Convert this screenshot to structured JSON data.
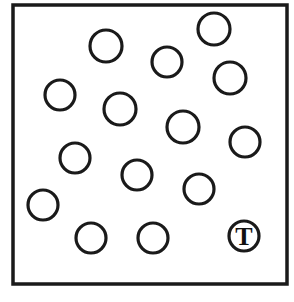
{
  "figure": {
    "background_color": "#ffffff",
    "stroke_color": "#1a1a1a",
    "width": 294,
    "height": 302
  },
  "frame": {
    "name": "box-border",
    "x": 13,
    "y": 5,
    "width": 274,
    "height": 279,
    "stroke_width": 3.5,
    "fill": "#ffffff"
  },
  "circles": [
    {
      "id": "circle-1",
      "label": "",
      "cx": 106,
      "cy": 46,
      "r": 16,
      "stroke_width": 3.2
    },
    {
      "id": "circle-2",
      "label": "",
      "cx": 214,
      "cy": 29,
      "r": 16,
      "stroke_width": 3.2
    },
    {
      "id": "circle-3",
      "label": "",
      "cx": 167,
      "cy": 62,
      "r": 15,
      "stroke_width": 3.2
    },
    {
      "id": "circle-4",
      "label": "",
      "cx": 60,
      "cy": 95,
      "r": 15,
      "stroke_width": 3.2
    },
    {
      "id": "circle-5",
      "label": "",
      "cx": 230,
      "cy": 78,
      "r": 16,
      "stroke_width": 3.2
    },
    {
      "id": "circle-6",
      "label": "",
      "cx": 120,
      "cy": 109,
      "r": 16,
      "stroke_width": 3.2
    },
    {
      "id": "circle-7",
      "label": "",
      "cx": 183,
      "cy": 127,
      "r": 16,
      "stroke_width": 3.2
    },
    {
      "id": "circle-8",
      "label": "",
      "cx": 245,
      "cy": 142,
      "r": 15,
      "stroke_width": 3.2
    },
    {
      "id": "circle-9",
      "label": "",
      "cx": 75,
      "cy": 158,
      "r": 15,
      "stroke_width": 3.2
    },
    {
      "id": "circle-10",
      "label": "",
      "cx": 137,
      "cy": 175,
      "r": 15,
      "stroke_width": 3.2
    },
    {
      "id": "circle-11",
      "label": "",
      "cx": 199,
      "cy": 189,
      "r": 15,
      "stroke_width": 3.2
    },
    {
      "id": "circle-12",
      "label": "",
      "cx": 43,
      "cy": 205,
      "r": 15,
      "stroke_width": 3.2
    },
    {
      "id": "circle-13",
      "label": "",
      "cx": 91,
      "cy": 238,
      "r": 15,
      "stroke_width": 3.2
    },
    {
      "id": "circle-14",
      "label": "",
      "cx": 153,
      "cy": 238,
      "r": 15,
      "stroke_width": 3.2
    }
  ],
  "labeled_circle": {
    "id": "circle-t",
    "label": "T",
    "cx": 244,
    "cy": 236,
    "r": 15,
    "stroke_width": 3.2,
    "label_font_size": 26,
    "label_color": "#111111"
  },
  "counts": {
    "plain_circles": 14,
    "labeled_circles": 1,
    "total_circles": 15
  }
}
